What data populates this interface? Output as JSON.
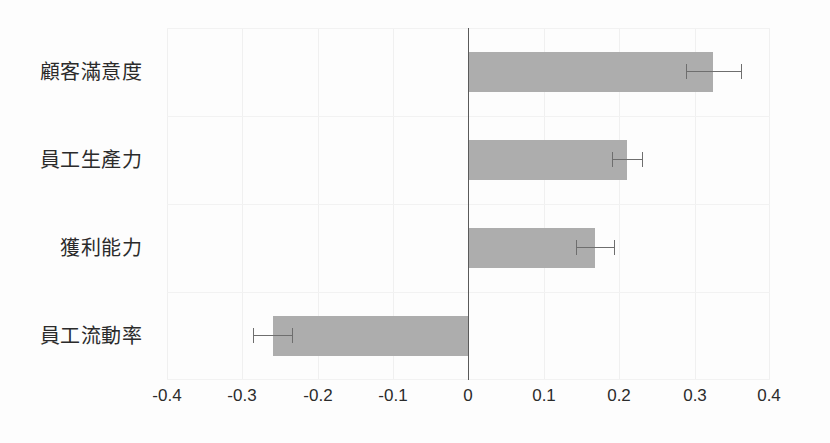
{
  "chart_data": {
    "type": "bar",
    "orientation": "horizontal",
    "title": "",
    "subtitle": "",
    "xlabel": "",
    "ylabel": "",
    "xlim": [
      -0.4,
      0.4
    ],
    "xticks": [
      "-0.4",
      "-0.3",
      "-0.2",
      "-0.1",
      "0",
      "0.1",
      "0.2",
      "0.3",
      "0.4"
    ],
    "xtick_values": [
      -0.4,
      -0.3,
      -0.2,
      -0.1,
      0,
      0.1,
      0.2,
      0.3,
      0.4
    ],
    "grid": true,
    "legend": null,
    "zero_line": true,
    "bar_color": "#adadad",
    "error_color": "#6e6e6e",
    "grid_color": "#f0f0f0",
    "background": "#fdfdfd",
    "categories": [
      "顧客滿意度",
      "員工生產力",
      "獲利能力",
      "員工流動率"
    ],
    "values": [
      0.325,
      0.21,
      0.168,
      -0.26
    ],
    "errors": [
      0.036,
      0.02,
      0.025,
      0.026
    ],
    "series": [
      {
        "name": "",
        "values": [
          0.325,
          0.21,
          0.168,
          -0.26
        ],
        "errors": [
          0.036,
          0.02,
          0.025,
          0.026
        ]
      }
    ],
    "points": [
      {
        "category": "顧客滿意度",
        "value": 0.325,
        "error": 0.036,
        "ci_low": 0.289,
        "ci_high": 0.361
      },
      {
        "category": "員工生產力",
        "value": 0.21,
        "error": 0.02,
        "ci_low": 0.19,
        "ci_high": 0.23
      },
      {
        "category": "獲利能力",
        "value": 0.168,
        "error": 0.025,
        "ci_low": 0.143,
        "ci_high": 0.193
      },
      {
        "category": "員工流動率",
        "value": -0.26,
        "error": 0.026,
        "ci_low": -0.286,
        "ci_high": -0.234
      }
    ]
  }
}
